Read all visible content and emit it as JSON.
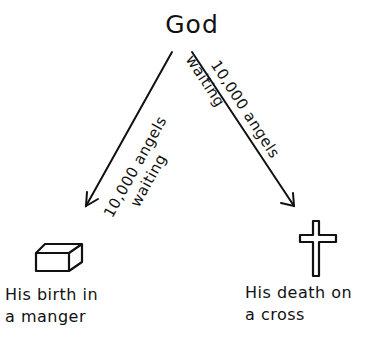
{
  "diagram": {
    "top_node": {
      "label": "God"
    },
    "arrows": [
      {
        "id": "left",
        "line1": "10,000 angels",
        "line2": "waiting"
      },
      {
        "id": "right",
        "line1": "10,000 angels",
        "line2": "waiting"
      }
    ],
    "nodes": [
      {
        "id": "manger",
        "icon": "manger-box-icon",
        "line1": "His birth in",
        "line2": "a manger"
      },
      {
        "id": "cross",
        "icon": "cross-icon",
        "line1": "His death on",
        "line2": "a cross"
      }
    ],
    "colors": {
      "ink": "#111111",
      "background": "#ffffff"
    }
  }
}
